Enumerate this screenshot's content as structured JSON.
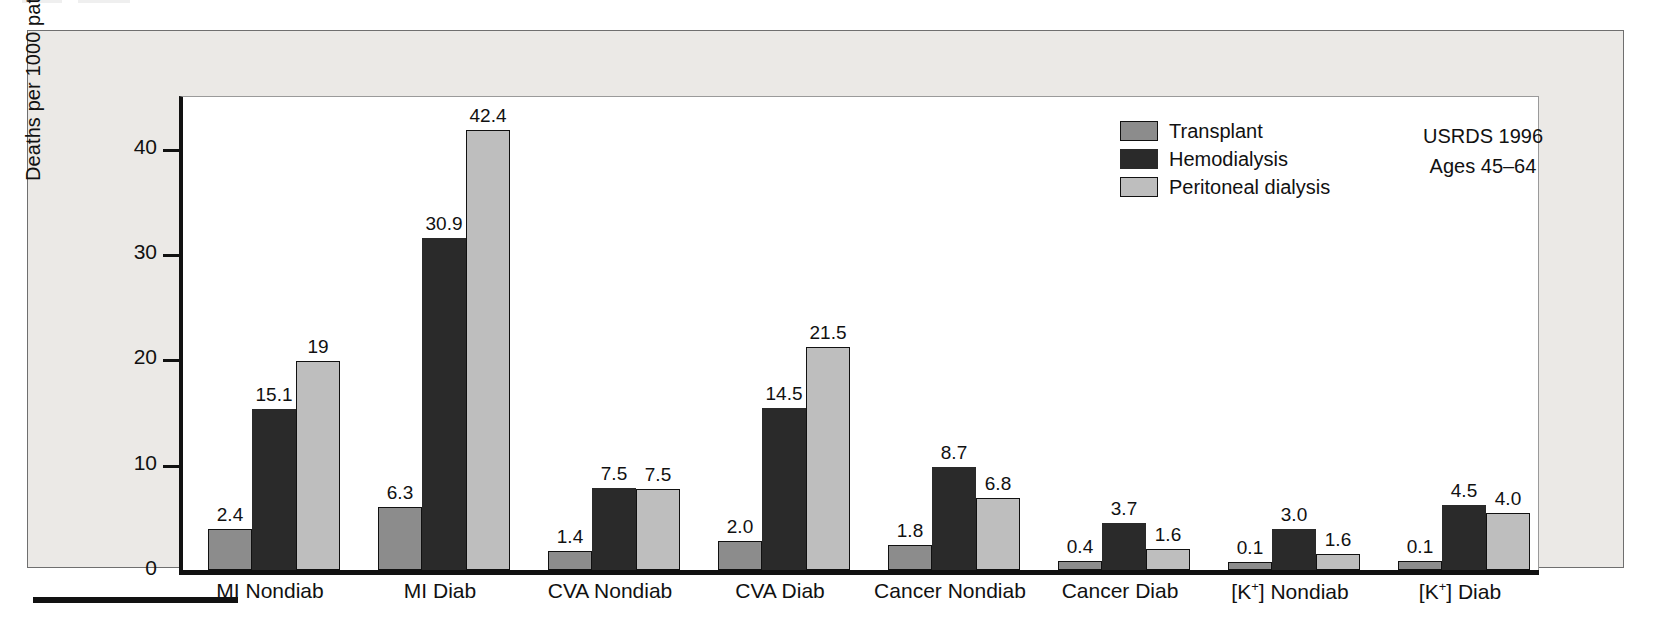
{
  "figure": {
    "y_axis_title": "Deaths per 1000 patient-years",
    "y_ticks": [
      "0",
      "10",
      "20",
      "30",
      "40"
    ],
    "annotation": {
      "line1": "USRDS 1996",
      "line2": "Ages 45–64"
    }
  },
  "legend": {
    "items": [
      {
        "label": "Transplant",
        "color": "#8c8c8c"
      },
      {
        "label": "Hemodialysis",
        "color": "#2a2a2a"
      },
      {
        "label": "Peritoneal dialysis",
        "color": "#bebebe"
      }
    ]
  },
  "chart_data": {
    "type": "bar",
    "title": "",
    "xlabel": "",
    "ylabel": "Deaths per 1000 patient-years",
    "ylim": [
      0,
      45
    ],
    "yticks": [
      0,
      10,
      20,
      30,
      40
    ],
    "grid": false,
    "legend_position": "top-right",
    "categories": [
      "MI Nondiab",
      "MI Diab",
      "CVA Nondiab",
      "CVA Diab",
      "Cancer Nondiab",
      "Cancer Diab",
      "[K+] Nondiab",
      "[K+] Diab"
    ],
    "category_labels_html": [
      "MI Nondiab",
      "MI Diab",
      "CVA Nondiab",
      "CVA Diab",
      "Cancer Nondiab",
      "Cancer Diab",
      "[K<sup>+</sup>] Nondiab",
      "[K<sup>+</sup>] Diab"
    ],
    "series": [
      {
        "name": "Transplant",
        "color": "#8c8c8c",
        "values": [
          2.4,
          6.3,
          1.4,
          2.0,
          1.8,
          0.4,
          0.1,
          0.1
        ],
        "labels": [
          "2.4",
          "6.3",
          "1.4",
          "2.0",
          "1.8",
          "0.4",
          "0.1",
          "0.1"
        ],
        "drawn_heights": [
          3.9,
          6.0,
          1.8,
          2.8,
          2.4,
          0.9,
          0.8,
          0.9
        ]
      },
      {
        "name": "Hemodialysis",
        "color": "#2a2a2a",
        "values": [
          15.1,
          30.9,
          7.5,
          14.5,
          8.7,
          3.7,
          3.0,
          4.5
        ],
        "labels": [
          "15.1",
          "30.9",
          "7.5",
          "14.5",
          "8.7",
          "3.7",
          "3.0",
          "4.5"
        ],
        "drawn_heights": [
          15.3,
          31.5,
          7.8,
          15.4,
          9.8,
          4.5,
          3.9,
          6.2
        ]
      },
      {
        "name": "Peritoneal dialysis",
        "color": "#bebebe",
        "values": [
          19,
          42.4,
          7.5,
          21.5,
          6.8,
          1.6,
          1.6,
          4.0
        ],
        "labels": [
          "19",
          "42.4",
          "7.5",
          "21.5",
          "6.8",
          "1.6",
          "1.6",
          "4.0"
        ],
        "drawn_heights": [
          19.8,
          41.8,
          7.7,
          21.2,
          6.8,
          2.0,
          1.5,
          5.4
        ]
      }
    ]
  }
}
